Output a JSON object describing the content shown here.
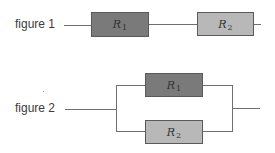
{
  "figures": [
    {
      "label": "figure 1",
      "type": "series",
      "resistors": [
        {
          "symbol": "R",
          "subscript": "1",
          "fill": "#7a7a7a"
        },
        {
          "symbol": "R",
          "subscript": "2",
          "fill": "#b8b8b8"
        }
      ]
    },
    {
      "label": "figure 2",
      "type": "parallel",
      "resistors": [
        {
          "symbol": "R",
          "subscript": "1",
          "fill": "#7a7a7a"
        },
        {
          "symbol": "R",
          "subscript": "2",
          "fill": "#b8b8b8"
        }
      ]
    }
  ]
}
